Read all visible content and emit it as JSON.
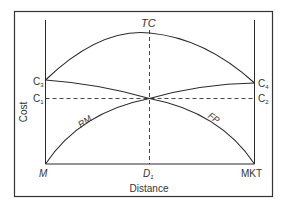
{
  "diagram": {
    "type": "location-cost-diagram",
    "axes": {
      "y_label": "Cost",
      "x_label": "Distance",
      "left_endpoint": "M",
      "right_endpoint": "MKT",
      "midpoint": "D",
      "midpoint_sub": "1"
    },
    "left_cost_labels": [
      {
        "base": "C",
        "sub": "3"
      },
      {
        "base": "C",
        "sub": "1"
      }
    ],
    "right_cost_labels": [
      {
        "base": "C",
        "sub": "4"
      },
      {
        "base": "C",
        "sub": "2"
      }
    ],
    "curves": [
      {
        "id": "TC",
        "label": "TC",
        "description": "Total cost curve, arching from C3 to peak at D1 to C4"
      },
      {
        "id": "RM",
        "label": "RM",
        "description": "Raw material transport cost rising from M"
      },
      {
        "id": "FP",
        "label": "FP",
        "description": "Finished product transport cost falling to MKT"
      }
    ],
    "colors": {
      "line": "#2a2a2a",
      "frame": "#333333",
      "background": "#ffffff"
    }
  }
}
